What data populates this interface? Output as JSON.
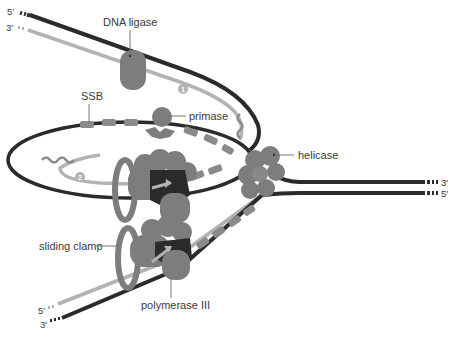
{
  "diagram": {
    "type": "DNA replication fork",
    "labels": {
      "dna_ligase": "DNA ligase",
      "ssb": "SSB",
      "primase": "primase",
      "helicase": "helicase",
      "sliding_clamp": "sliding clamp",
      "polymerase": "polymerase III"
    },
    "strand_ends": {
      "top_left_dark": "5'",
      "top_left_light": "3'",
      "right_upper": "3'",
      "right_lower": "5'",
      "bottom_left_light": "5'",
      "bottom_left_dark": "3'"
    },
    "okazaki_markers": {
      "fragment_1": "1",
      "fragment_2": "2"
    },
    "colors": {
      "template_strand": "#2b2b2b",
      "new_strand": "#b3b3b3",
      "protein": "#7d7d7d",
      "protein_dark": "#5e5e5e",
      "ssb": "#8a8a8a",
      "label_text": "#3a3a3a",
      "background": "#ffffff"
    }
  }
}
